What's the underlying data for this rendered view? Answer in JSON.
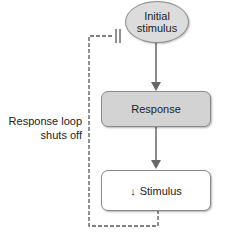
{
  "diagram": {
    "nodes": {
      "initial_stimulus": {
        "line1": "Initial",
        "line2": "stimulus",
        "shape": "ellipse",
        "fill": "#dcdcdc"
      },
      "response": {
        "label": "Response",
        "shape": "rounded-rect",
        "fill": "#d3d3d3"
      },
      "stimulus": {
        "arrow": "↓",
        "label": "Stimulus",
        "shape": "rounded-rect",
        "fill": "#ffffff"
      }
    },
    "edges": [
      {
        "from": "initial_stimulus",
        "to": "response",
        "style": "solid-arrow"
      },
      {
        "from": "response",
        "to": "stimulus",
        "style": "solid-arrow"
      },
      {
        "from": "stimulus",
        "to": "initial_stimulus",
        "style": "dashed-inhibition"
      }
    ],
    "loop_label": {
      "line1": "Response loop",
      "line2": "shuts off"
    }
  }
}
